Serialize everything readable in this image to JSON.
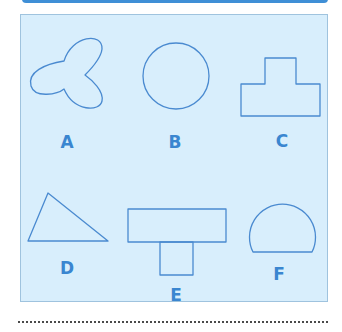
{
  "figure": {
    "colors": {
      "header_bar": "#3f8fd6",
      "panel_background": "#d8eefc",
      "panel_border": "#9fc3de",
      "shape_stroke": "#4a8ad0",
      "label_color": "#3a86d0"
    },
    "shapes": [
      {
        "label": "A",
        "kind": "three-lobed clover"
      },
      {
        "label": "B",
        "kind": "circle"
      },
      {
        "label": "C",
        "kind": "stepped T-shape (small rectangle on top of wide rectangle)"
      },
      {
        "label": "D",
        "kind": "triangle"
      },
      {
        "label": "E",
        "kind": "T-shape (wide rectangle above small square)"
      },
      {
        "label": "F",
        "kind": "circular segment (dome)"
      }
    ]
  }
}
